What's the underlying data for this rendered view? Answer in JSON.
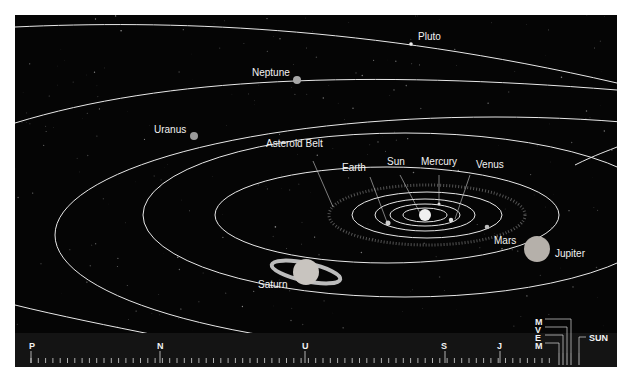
{
  "diagram": {
    "type": "solar-system-orbits",
    "background_color": "#050505",
    "orbit_color": "#e8e8e8",
    "label_color": "#f2f2f2"
  },
  "bodies": [
    {
      "id": "sun",
      "label": "Sun"
    },
    {
      "id": "mercury",
      "label": "Mercury"
    },
    {
      "id": "venus",
      "label": "Venus"
    },
    {
      "id": "earth",
      "label": "Earth"
    },
    {
      "id": "mars",
      "label": "Mars"
    },
    {
      "id": "asteroid_belt",
      "label": "Asteroid Belt"
    },
    {
      "id": "jupiter",
      "label": "Jupiter"
    },
    {
      "id": "saturn",
      "label": "Saturn"
    },
    {
      "id": "uranus",
      "label": "Uranus"
    },
    {
      "id": "neptune",
      "label": "Neptune"
    },
    {
      "id": "pluto",
      "label": "Pluto"
    }
  ],
  "scale_bar": {
    "markers": [
      {
        "label": "P"
      },
      {
        "label": "N"
      },
      {
        "label": "U"
      },
      {
        "label": "S"
      },
      {
        "label": "J"
      }
    ],
    "inner_stack": [
      "M",
      "V",
      "E",
      "M"
    ],
    "sun_label": "SUN"
  }
}
